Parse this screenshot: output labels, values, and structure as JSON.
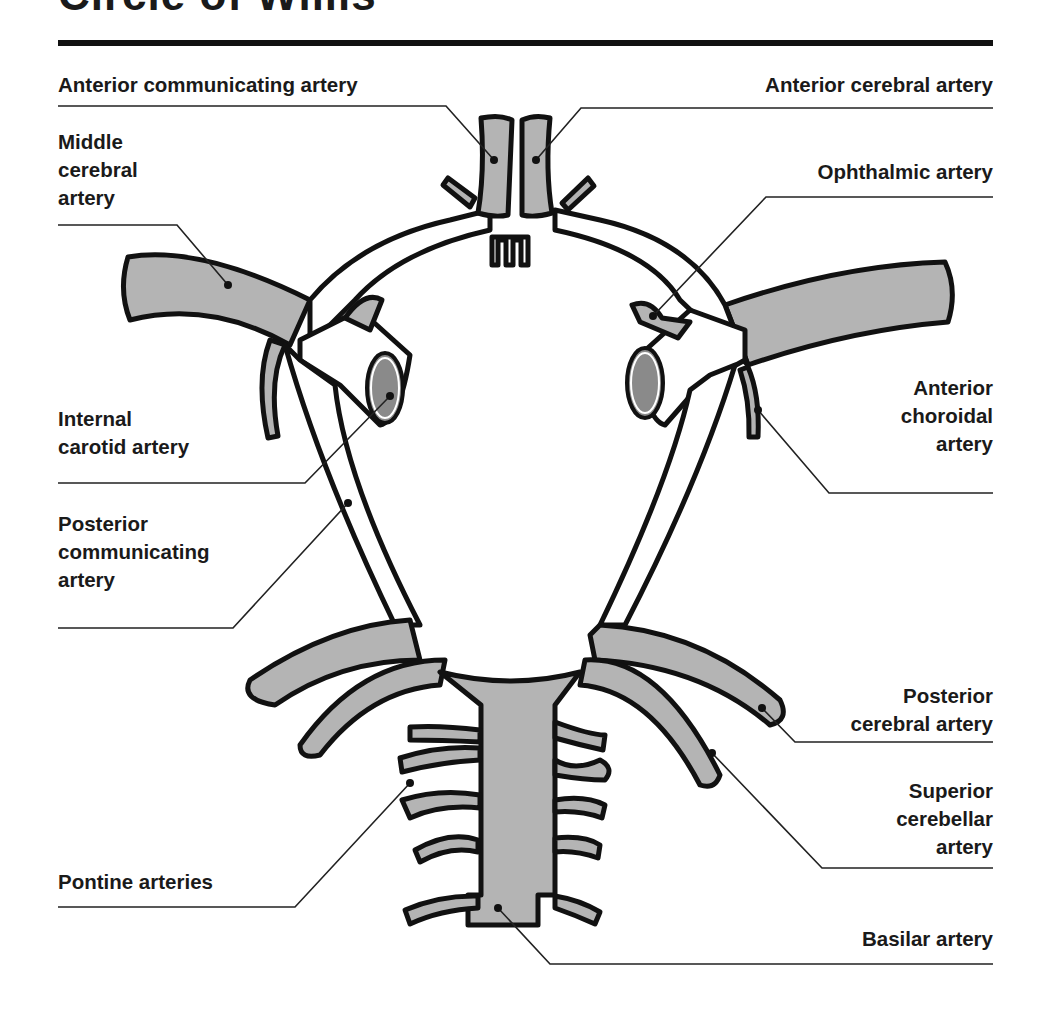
{
  "figure": {
    "title": "Circle of Willis",
    "title_partially_cropped": true
  },
  "colors": {
    "artery_fill": "#b4b4b4",
    "artery_outline": "#111111",
    "ica_lumen": "#8a8a8a",
    "rule": "#111111",
    "background": "#ffffff"
  },
  "labels": {
    "anterior_communicating": "Anterior communicating artery",
    "anterior_cerebral": "Anterior cerebral artery",
    "middle_cerebral": [
      "Middle",
      "cerebral",
      "artery"
    ],
    "ophthalmic": "Ophthalmic artery",
    "internal_carotid": [
      "Internal",
      "carotid artery"
    ],
    "anterior_choroidal": [
      "Anterior",
      "choroidal",
      "artery"
    ],
    "posterior_communicating": [
      "Posterior",
      "communicating",
      "artery"
    ],
    "posterior_cerebral": [
      "Posterior",
      "cerebral artery"
    ],
    "superior_cerebellar": [
      "Superior",
      "cerebellar",
      "artery"
    ],
    "pontine": "Pontine arteries",
    "basilar": "Basilar artery"
  }
}
